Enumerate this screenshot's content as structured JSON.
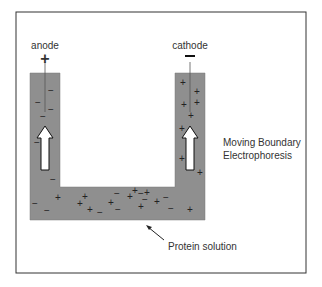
{
  "diagram": {
    "title_line1": "Moving Boundary",
    "title_line2": "Electrophoresis",
    "anode": {
      "label": "anode",
      "sign": "+"
    },
    "cathode": {
      "label": "cathode",
      "sign": "−"
    },
    "pointer_label": "Protein solution",
    "colors": {
      "solution": "#8f8f8f",
      "frame": "#333333",
      "arrow_fill": "#ffffff",
      "text": "#333333"
    },
    "charges": {
      "left_tube": [
        "−",
        "−",
        "−",
        "−",
        "−",
        "−"
      ],
      "right_tube": [
        "+",
        "+",
        "+",
        "+",
        "+",
        "+",
        "+",
        "+"
      ],
      "bottom_channel": [
        "−",
        "+",
        "−",
        "+",
        "+",
        "−",
        "+",
        "−",
        "+",
        "−",
        "+",
        "+",
        "−",
        "+",
        "−",
        "+",
        "−",
        "+",
        "−",
        "+"
      ]
    },
    "flow_arrows": [
      {
        "side": "left",
        "direction": "up",
        "icon": "up-arrow-icon"
      },
      {
        "side": "right",
        "direction": "up",
        "icon": "up-arrow-icon"
      }
    ]
  }
}
